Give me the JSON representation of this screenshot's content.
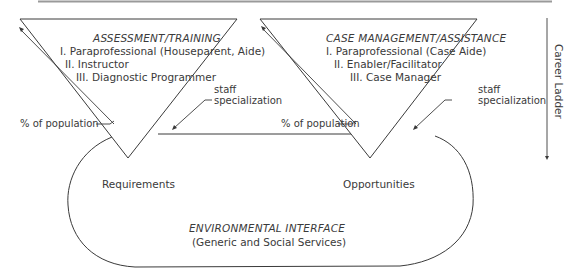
{
  "diagram": {
    "left_triangle": {
      "title": "ASSESSMENT/TRAINING",
      "levels": [
        "I.  Paraprofessional (Houseparent, Aide)",
        "II.  Instructor",
        "III.  Diagnostic Programmer"
      ],
      "staff_label_line1": "staff",
      "staff_label_line2": "specialization",
      "population_label": "% of population"
    },
    "right_triangle": {
      "title": "CASE MANAGEMENT/ASSISTANCE",
      "levels": [
        "I.  Paraprofessional (Case Aide)",
        "II.  Enabler/Facilitator",
        "III.  Case Manager"
      ],
      "staff_label_line1": "staff",
      "staff_label_line2": "specialization",
      "population_label": "% of population"
    },
    "interface": {
      "left_label": "Requirements",
      "right_label": "Opportunities",
      "title": "ENVIRONMENTAL INTERFACE",
      "subtitle": "(Generic and Social Services)"
    },
    "side_axis": {
      "label": "Career Ladder"
    },
    "colors": {
      "line": "#3a3a3a",
      "top_rule": "#9a9a9a"
    }
  }
}
